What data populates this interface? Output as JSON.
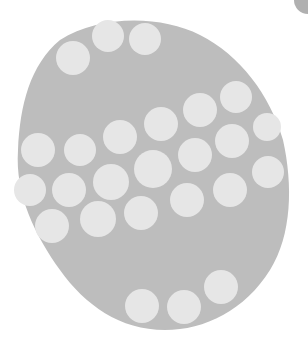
{
  "image": {
    "description": "Grey egg-shaped form with pale circular dots",
    "colors": {
      "background": "#ffffff",
      "egg": "#bdbdbd",
      "dot": "#e6e6e6",
      "corner": "#8f8f8f"
    },
    "dots": [
      {
        "cx": 73,
        "cy": 58,
        "r": 17
      },
      {
        "cx": 108,
        "cy": 36,
        "r": 16
      },
      {
        "cx": 145,
        "cy": 39,
        "r": 16
      },
      {
        "cx": 236,
        "cy": 97,
        "r": 16
      },
      {
        "cx": 200,
        "cy": 110,
        "r": 17
      },
      {
        "cx": 161,
        "cy": 124,
        "r": 17
      },
      {
        "cx": 267,
        "cy": 127,
        "r": 14
      },
      {
        "cx": 120,
        "cy": 137,
        "r": 17
      },
      {
        "cx": 80,
        "cy": 150,
        "r": 16
      },
      {
        "cx": 38,
        "cy": 150,
        "r": 17
      },
      {
        "cx": 232,
        "cy": 141,
        "r": 17
      },
      {
        "cx": 195,
        "cy": 155,
        "r": 17
      },
      {
        "cx": 153,
        "cy": 169,
        "r": 19
      },
      {
        "cx": 111,
        "cy": 182,
        "r": 18
      },
      {
        "cx": 69,
        "cy": 190,
        "r": 17
      },
      {
        "cx": 30,
        "cy": 190,
        "r": 16
      },
      {
        "cx": 268,
        "cy": 172,
        "r": 16
      },
      {
        "cx": 230,
        "cy": 190,
        "r": 17
      },
      {
        "cx": 187,
        "cy": 200,
        "r": 17
      },
      {
        "cx": 141,
        "cy": 213,
        "r": 17
      },
      {
        "cx": 98,
        "cy": 219,
        "r": 18
      },
      {
        "cx": 52,
        "cy": 226,
        "r": 17
      },
      {
        "cx": 221,
        "cy": 287,
        "r": 17
      },
      {
        "cx": 184,
        "cy": 307,
        "r": 17
      },
      {
        "cx": 142,
        "cy": 306,
        "r": 17
      }
    ]
  }
}
